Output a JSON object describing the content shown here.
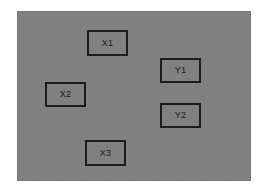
{
  "canvas": {
    "background_color": "#808080",
    "page_background_color": "#ffffff",
    "x": 17,
    "y": 11,
    "width": 234,
    "height": 170
  },
  "style": {
    "node_border_color": "#1c1c1c",
    "node_border_width": 2,
    "node_fill": "transparent",
    "label_color": "#1a1a1a",
    "label_font_size": 9
  },
  "nodes": [
    {
      "id": "x1",
      "label": "X1",
      "x": 87,
      "y": 30,
      "width": 41,
      "height": 26,
      "group": "X"
    },
    {
      "id": "y1",
      "label": "Y1",
      "x": 160,
      "y": 58,
      "width": 41,
      "height": 25,
      "group": "Y"
    },
    {
      "id": "x2",
      "label": "X2",
      "x": 45,
      "y": 82,
      "width": 41,
      "height": 25,
      "group": "X"
    },
    {
      "id": "y2",
      "label": "Y2",
      "x": 160,
      "y": 103,
      "width": 41,
      "height": 25,
      "group": "Y"
    },
    {
      "id": "x3",
      "label": "X3",
      "x": 85,
      "y": 140,
      "width": 41,
      "height": 26,
      "group": "X"
    }
  ],
  "edges": []
}
